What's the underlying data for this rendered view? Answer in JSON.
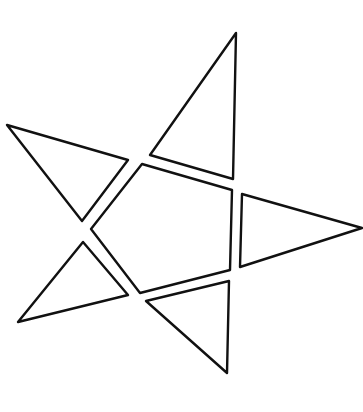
{
  "diagram": {
    "stroke_color": "#111111",
    "background_color": "#ffffff",
    "pieces": [
      {
        "name": "top-triangle",
        "points": "236,33 150,155 233,179"
      },
      {
        "name": "left-triangle",
        "points": "7,125 128,160 82,221"
      },
      {
        "name": "right-triangle",
        "points": "242,194 362,228 240,267"
      },
      {
        "name": "bottom-left-triangle",
        "points": "83,242 128,295 18,322"
      },
      {
        "name": "bottom-triangle",
        "points": "146,301 229,281 227,373"
      },
      {
        "name": "center-pentagon",
        "points": "142,164 232,190 230,270 140,293 91,229"
      }
    ]
  }
}
